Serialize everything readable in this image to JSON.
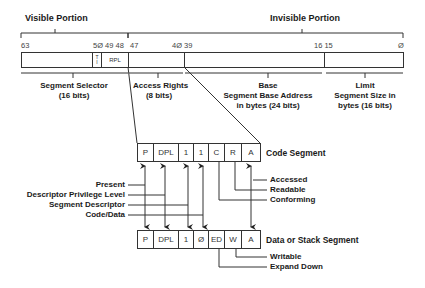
{
  "descriptor": {
    "visible_header": "Visible Portion",
    "invisible_header": "Invisible Portion",
    "bit_numbers": {
      "b63": "63",
      "b50_49_48": "5Ø 49 48",
      "b47": "47",
      "b40_39": "4Ø 39",
      "b16_15": "16 15",
      "b0": "Ø"
    },
    "fields": {
      "ti": "T\nI",
      "ti_top": "T",
      "ti_bottom": "I",
      "rpl": "RPL"
    },
    "labels": {
      "selector_title": "Segment Selector",
      "selector_bits": "(16 bits)",
      "access_title": "Access Rights",
      "access_bits": "(8 bits)",
      "base_title": "Base",
      "base_desc": "Segment Base Address",
      "base_bits": "in bytes (24 bits)",
      "limit_title": "Limit",
      "limit_desc": "Segment Size in",
      "limit_bits": "bytes (16 bits)"
    }
  },
  "code_segment": {
    "title": "Code Segment",
    "cells": [
      "P",
      "DPL",
      "1",
      "1",
      "C",
      "R",
      "A"
    ],
    "flags": [
      "Accessed",
      "Readable",
      "Conforming"
    ]
  },
  "data_segment": {
    "title": "Data or Stack Segment",
    "cells": [
      "P",
      "DPL",
      "1",
      "Ø",
      "ED",
      "W",
      "A"
    ],
    "flags": [
      "Writable",
      "Expand Down"
    ]
  },
  "common_flags": [
    "Present",
    "Descriptor Privilege Level",
    "Segment Descriptor",
    "Code/Data"
  ]
}
